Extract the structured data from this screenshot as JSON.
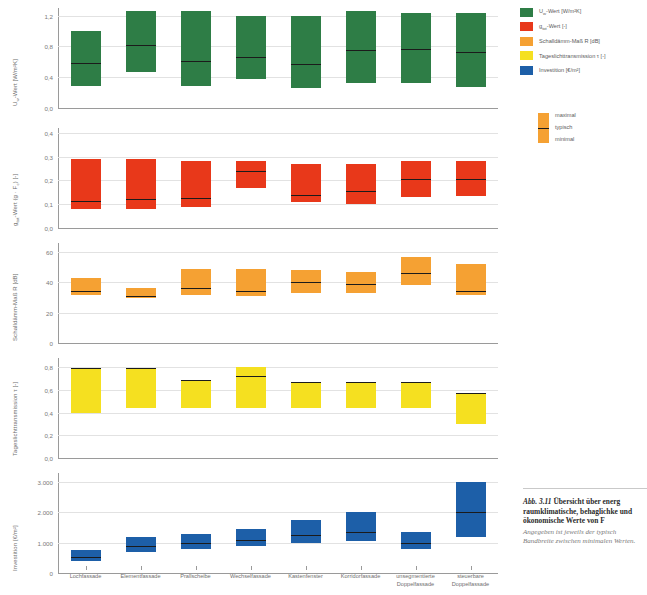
{
  "figure": {
    "caption_number": "Abb. 3.11",
    "caption_title": "Übersicht über energ",
    "caption_line2": "raumklimatische, behaglichke",
    "caption_line3": "und ökonomische Werte von F",
    "caption_note1": "Angegeben ist jeweils der typisch",
    "caption_note2": "Bandbreite zwischen minimalen",
    "caption_note3": "Werten."
  },
  "legend": {
    "items": [
      {
        "label": "U",
        "sub": "w",
        "rest": "-Wert [W/m²K]",
        "color": "#2e7d46"
      },
      {
        "label": "g",
        "sub": "tot",
        "rest": "-Wert [-]",
        "color": "#e8381a"
      },
      {
        "label": "Schalldämm-Maß R [dB]",
        "sub": "",
        "rest": "",
        "color": "#f5a133"
      },
      {
        "label": "Tageslichttransmission τ [-]",
        "sub": "",
        "rest": "",
        "color": "#f5e020"
      },
      {
        "label": "Investition [€/m²]",
        "sub": "",
        "rest": "",
        "color": "#1d5fa8"
      }
    ],
    "range_legend": {
      "max": "maximal",
      "typ": "typisch",
      "min": "minimal",
      "color": "#f5a133"
    }
  },
  "chart_data": {
    "type": "bar",
    "xlabel": "",
    "grid": true,
    "legend_position": "right",
    "categories": [
      "Lochfassade",
      "Elementfassade",
      "Prallscheibe",
      "Wechselfassade",
      "Kastenfenster",
      "Korridorfassade",
      "unsegmentierte Doppelfassade",
      "steuerbare Doppelfassade"
    ],
    "panels": [
      {
        "key": "u_value",
        "ylabel": "U",
        "ylabel_sub": "w",
        "ylabel_rest": "-Wert [W/m²K]",
        "ylim": [
          0,
          1.3
        ],
        "ticks": [
          0.0,
          0.4,
          0.8,
          1.2
        ],
        "ticklabels": [
          "0,0",
          "0,4",
          "0,8",
          "1,2"
        ],
        "color": "#2e7d46",
        "clip_top": 1.26,
        "values": [
          {
            "min": 0.28,
            "typical": 0.58,
            "max": 1.0
          },
          {
            "min": 0.47,
            "typical": 0.82,
            "max": 1.26
          },
          {
            "min": 0.28,
            "typical": 0.61,
            "max": 1.26
          },
          {
            "min": 0.38,
            "typical": 0.66,
            "max": 1.19
          },
          {
            "min": 0.26,
            "typical": 0.57,
            "max": 1.19
          },
          {
            "min": 0.33,
            "typical": 0.75,
            "max": 1.26
          },
          {
            "min": 0.32,
            "typical": 0.77,
            "max": 1.23
          },
          {
            "min": 0.27,
            "typical": 0.73,
            "max": 1.23
          }
        ]
      },
      {
        "key": "g_value",
        "ylabel": "g",
        "ylabel_sub": "tot",
        "ylabel_rest": "-Wert (g · F",
        "ylabel_rest2": ") [-]",
        "ylabel_sub2": "c",
        "ylim": [
          0,
          0.42
        ],
        "ticks": [
          0.0,
          0.1,
          0.2,
          0.3,
          0.4
        ],
        "ticklabels": [
          "0,0",
          "0,1",
          "0,2",
          "0,3",
          "0,4"
        ],
        "color": "#e8381a",
        "values": [
          {
            "min": 0.08,
            "typical": 0.115,
            "max": 0.29
          },
          {
            "min": 0.08,
            "typical": 0.12,
            "max": 0.29
          },
          {
            "min": 0.09,
            "typical": 0.125,
            "max": 0.28
          },
          {
            "min": 0.17,
            "typical": 0.24,
            "max": 0.28
          },
          {
            "min": 0.11,
            "typical": 0.14,
            "max": 0.27
          },
          {
            "min": 0.1,
            "typical": 0.155,
            "max": 0.27
          },
          {
            "min": 0.13,
            "typical": 0.205,
            "max": 0.28
          },
          {
            "min": 0.135,
            "typical": 0.205,
            "max": 0.28
          }
        ]
      },
      {
        "key": "sound",
        "ylabel": "Schalldämm-Maß R [dB]",
        "ylim": [
          0,
          66
        ],
        "ticks": [
          0,
          20,
          40,
          60
        ],
        "ticklabels": [
          "0",
          "20",
          "40",
          "60"
        ],
        "color": "#f5a133",
        "values": [
          {
            "min": 32,
            "typical": 34,
            "max": 43
          },
          {
            "min": 30,
            "typical": 31,
            "max": 36
          },
          {
            "min": 32,
            "typical": 36,
            "max": 49
          },
          {
            "min": 31,
            "typical": 34,
            "max": 49
          },
          {
            "min": 33,
            "typical": 40,
            "max": 48
          },
          {
            "min": 33,
            "typical": 39,
            "max": 47
          },
          {
            "min": 38,
            "typical": 46,
            "max": 57
          },
          {
            "min": 32,
            "typical": 34,
            "max": 52
          }
        ]
      },
      {
        "key": "daylight",
        "ylabel": "Tageslichttransmission τ [-]",
        "ylim": [
          0,
          0.88
        ],
        "ticks": [
          0.0,
          0.2,
          0.4,
          0.6,
          0.8
        ],
        "ticklabels": [
          "0,0",
          "0,2",
          "0,4",
          "0,6",
          "0,8"
        ],
        "color": "#f5e020",
        "values": [
          {
            "min": 0.4,
            "typical": 0.79,
            "max": 0.79
          },
          {
            "min": 0.44,
            "typical": 0.79,
            "max": 0.79
          },
          {
            "min": 0.44,
            "typical": 0.69,
            "max": 0.69
          },
          {
            "min": 0.44,
            "typical": 0.72,
            "max": 0.8
          },
          {
            "min": 0.44,
            "typical": 0.67,
            "max": 0.67
          },
          {
            "min": 0.44,
            "typical": 0.67,
            "max": 0.67
          },
          {
            "min": 0.44,
            "typical": 0.67,
            "max": 0.67
          },
          {
            "min": 0.3,
            "typical": 0.57,
            "max": 0.57
          }
        ]
      },
      {
        "key": "investment",
        "ylabel": "Investition [€/m²]",
        "ylim": [
          0,
          3300
        ],
        "ticks": [
          0,
          1000,
          2000,
          3000
        ],
        "ticklabels": [
          "0",
          "1.000",
          "2.000",
          "3.000"
        ],
        "color": "#1d5fa8",
        "values": [
          {
            "min": 400,
            "typical": 520,
            "max": 750
          },
          {
            "min": 700,
            "typical": 880,
            "max": 1200
          },
          {
            "min": 800,
            "typical": 1000,
            "max": 1300
          },
          {
            "min": 900,
            "typical": 1100,
            "max": 1450
          },
          {
            "min": 1000,
            "typical": 1250,
            "max": 1750
          },
          {
            "min": 1050,
            "typical": 1350,
            "max": 2000
          },
          {
            "min": 800,
            "typical": 1000,
            "max": 1350
          },
          {
            "min": 1200,
            "typical": 2000,
            "max": 3000
          }
        ]
      }
    ]
  }
}
